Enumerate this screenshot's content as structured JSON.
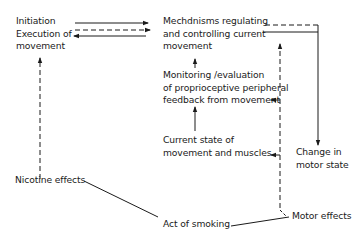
{
  "diagram": {
    "nodes": {
      "initiation": {
        "line1": "Initiation",
        "line2": "Execution of",
        "line3": "movement"
      },
      "mechanisms": {
        "line1": "Mechdnisms regulating",
        "line2": "and controlling current",
        "line3": "movement"
      },
      "monitoring": {
        "line1": "Monitoring /evaluation",
        "line2": "of proprioceptive peripheral",
        "line3": "feedback from movement"
      },
      "current_state": {
        "line1": "Current state of",
        "line2": "movement and muscles"
      },
      "change": {
        "line1": "Change in",
        "line2": "motor state"
      },
      "nicotine": {
        "label": "Nicotine effects"
      },
      "smoking": {
        "label": "Act of smoking"
      },
      "motor_effects": {
        "label": "Motor effects"
      }
    },
    "colors": {
      "line": "#1a1a1a",
      "background": "#ffffff"
    }
  }
}
